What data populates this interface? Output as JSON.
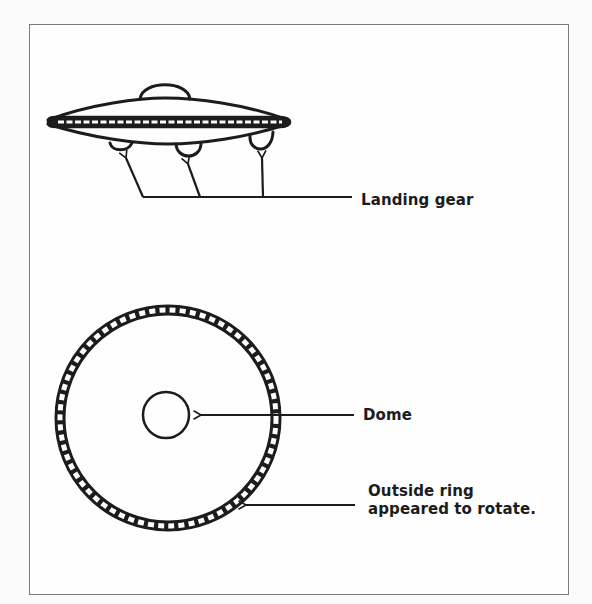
{
  "figure": {
    "side_view": {
      "description": "Side view of saucer with top dome, segmented rim band and three landing-gear bumps",
      "annotation": {
        "label": "Landing gear",
        "arrow_count": 3
      }
    },
    "top_view": {
      "description": "Top view: large circle with segmented outer ring and small central circle",
      "annotations": [
        {
          "id": "dome",
          "label": "Dome"
        },
        {
          "id": "ring",
          "label_line1": "Outside ring",
          "label_line2": "appeared to rotate."
        }
      ]
    }
  },
  "colors": {
    "ink": "#1c1c1c",
    "paper": "#fefefe",
    "frame": "#7a7a7a"
  }
}
